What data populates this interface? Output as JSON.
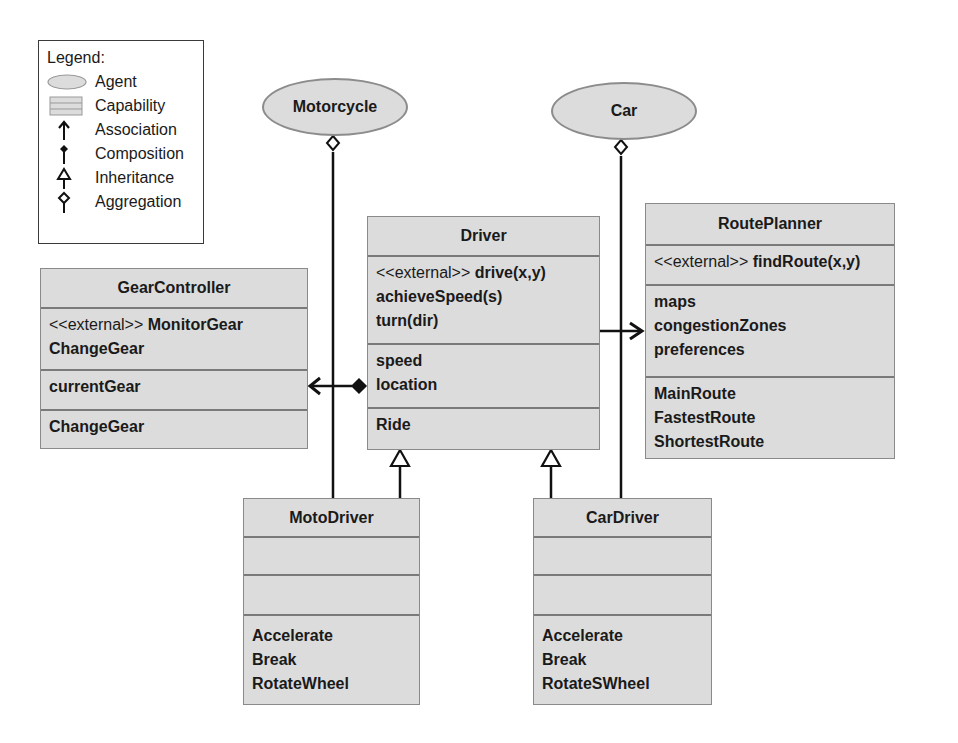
{
  "legend": {
    "title": "Legend:",
    "items": [
      {
        "symbol": "agent-ellipse",
        "label": "Agent"
      },
      {
        "symbol": "capability-box",
        "label": "Capability"
      },
      {
        "symbol": "association-arrow",
        "label": "Association"
      },
      {
        "symbol": "composition-diamond-filled",
        "label": "Composition"
      },
      {
        "symbol": "inheritance-triangle",
        "label": "Inheritance"
      },
      {
        "symbol": "aggregation-diamond-hollow",
        "label": "Aggregation"
      }
    ]
  },
  "agents": [
    {
      "id": "motorcycle",
      "label": "Motorcycle"
    },
    {
      "id": "car",
      "label": "Car"
    }
  ],
  "classes": {
    "driver": {
      "name": "Driver",
      "operations": [
        {
          "stereotype": "<<external>> ",
          "text": "drive(x,y)"
        },
        {
          "stereotype": "",
          "text": "achieveSpeed(s)"
        },
        {
          "stereotype": "",
          "text": "turn(dir)"
        }
      ],
      "attributes": [
        "speed",
        "location"
      ],
      "capabilities": [
        "Ride"
      ]
    },
    "route_planner": {
      "name": "RoutePlanner",
      "operations": [
        {
          "stereotype": "<<external>> ",
          "text": "findRoute(x,y)"
        }
      ],
      "attributes": [
        "maps",
        "congestionZones",
        "preferences"
      ],
      "capabilities": [
        "MainRoute",
        "FastestRoute",
        "ShortestRoute"
      ]
    },
    "gear_controller": {
      "name": "GearController",
      "operations": [
        {
          "stereotype": "<<external>> ",
          "text": "MonitorGear"
        },
        {
          "stereotype": "",
          "text": "ChangeGear"
        }
      ],
      "attributes": [
        "currentGear"
      ],
      "capabilities": [
        "ChangeGear"
      ]
    },
    "moto_driver": {
      "name": "MotoDriver",
      "operations": [],
      "attributes": [],
      "capabilities": [
        "Accelerate",
        "Break",
        "RotateWheel"
      ]
    },
    "car_driver": {
      "name": "CarDriver",
      "operations": [],
      "attributes": [],
      "capabilities": [
        "Accelerate",
        "Break",
        "RotateSWheel"
      ]
    }
  },
  "relations": [
    {
      "type": "aggregation",
      "from": "Motorcycle",
      "to": "MotoDriver"
    },
    {
      "type": "aggregation",
      "from": "Car",
      "to": "CarDriver"
    },
    {
      "type": "association",
      "from": "Driver",
      "to": "RoutePlanner"
    },
    {
      "type": "composition",
      "from": "Driver",
      "to": "GearController"
    },
    {
      "type": "inheritance",
      "from": "MotoDriver",
      "to": "Driver"
    },
    {
      "type": "inheritance",
      "from": "CarDriver",
      "to": "Driver"
    }
  ]
}
